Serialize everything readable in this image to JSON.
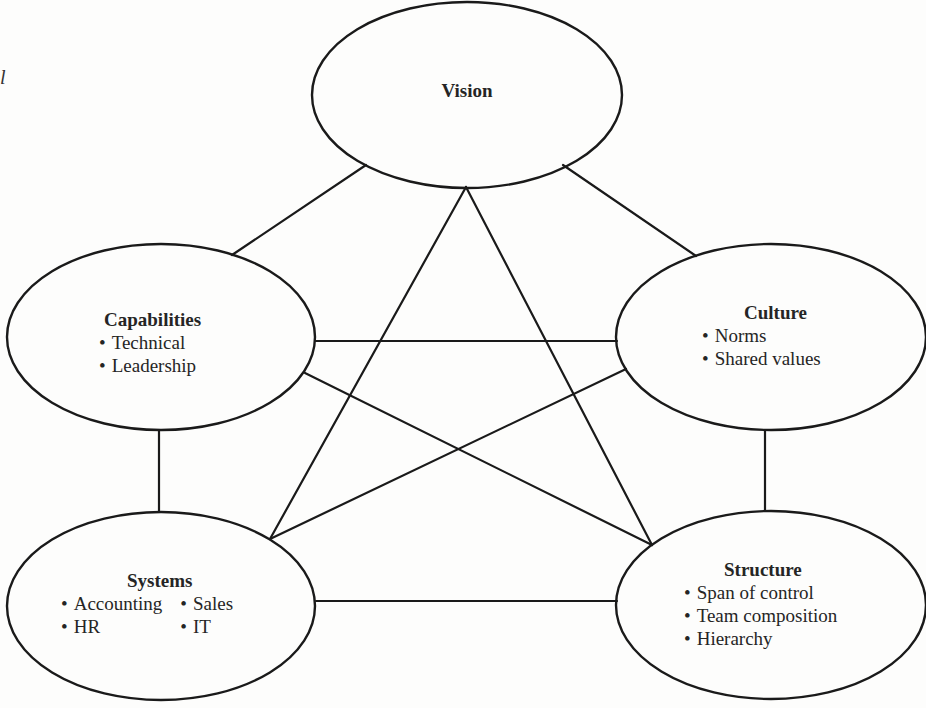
{
  "stray_text": "l",
  "nodes": {
    "vision": {
      "title": "Vision",
      "bullets": []
    },
    "capabilities": {
      "title": "Capabilities",
      "bullets": [
        "Technical",
        "Leadership"
      ]
    },
    "culture": {
      "title": "Culture",
      "bullets": [
        "Norms",
        "Shared values"
      ]
    },
    "systems": {
      "title": "Systems",
      "columns": [
        [
          "Accounting",
          "HR"
        ],
        [
          "Sales",
          "IT"
        ]
      ]
    },
    "structure": {
      "title": "Structure",
      "bullets": [
        "Span of control",
        "Team composition",
        "Hierarchy"
      ]
    }
  },
  "edges": [
    {
      "from": "vision",
      "to": "capabilities"
    },
    {
      "from": "vision",
      "to": "culture"
    },
    {
      "from": "vision",
      "to": "systems"
    },
    {
      "from": "vision",
      "to": "structure"
    },
    {
      "from": "capabilities",
      "to": "culture"
    },
    {
      "from": "capabilities",
      "to": "systems"
    },
    {
      "from": "capabilities",
      "to": "structure"
    },
    {
      "from": "culture",
      "to": "systems"
    },
    {
      "from": "culture",
      "to": "structure"
    },
    {
      "from": "systems",
      "to": "structure"
    }
  ],
  "colors": {
    "stroke": "#1a1a1a",
    "background": "#fdfdfc",
    "text": "#252525"
  }
}
